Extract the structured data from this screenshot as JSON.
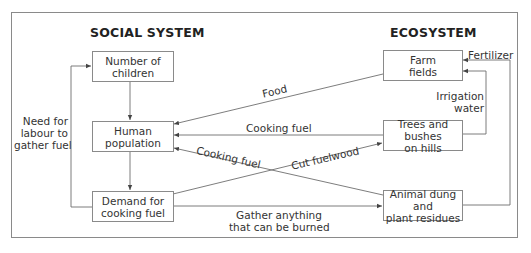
{
  "sections": {
    "social": {
      "title": "SOCIAL SYSTEM"
    },
    "eco": {
      "title": "ECOSYSTEM"
    }
  },
  "nodes": {
    "children": {
      "line1": "Number of",
      "line2": "children"
    },
    "population": {
      "line1": "Human",
      "line2": "population"
    },
    "demand": {
      "line1": "Demand for",
      "line2": "cooking fuel"
    },
    "farm": {
      "line1": "Farm",
      "line2": "fields"
    },
    "trees": {
      "line1": "Trees and bushes",
      "line2": "on hills"
    },
    "dung": {
      "line1": "Animal dung and",
      "line2": "plant residues"
    }
  },
  "edges": {
    "food": "Food",
    "cooking_fuel_trees": "Cooking fuel",
    "cooking_fuel_dung": "Cooking fuel",
    "cut_fuelwood": "Cut fuelwood",
    "gather": {
      "line1": "Gather anything",
      "line2": "that can be burned"
    },
    "labour": {
      "line1": "Need for",
      "line2": "labour to",
      "line3": "gather fuel"
    },
    "irrigation": {
      "line1": "Irrigation",
      "line2": "water"
    },
    "fertilizer": "Fertilizer"
  },
  "colors": {
    "line": "#6e6e6e",
    "border": "#8a8a8a",
    "text": "#333333"
  }
}
